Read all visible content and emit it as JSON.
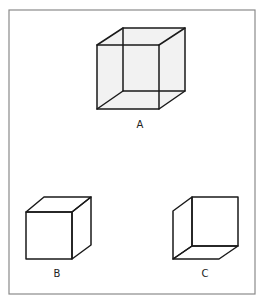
{
  "figure": {
    "frame": {
      "x": 9,
      "y": 10,
      "width": 246,
      "height": 284,
      "stroke": "#8a8a8a"
    },
    "colors": {
      "edge": "#1a1a1a",
      "face_fill": "#f2f2f2",
      "label": "#222222",
      "background": "#ffffff"
    },
    "cubes": [
      {
        "id": "A",
        "label": "A",
        "kind": "wireframe-ambiguous",
        "shaded": true,
        "front": {
          "tl": [
            97,
            45
          ],
          "tr": [
            159,
            45
          ],
          "br": [
            159,
            109
          ],
          "bl": [
            97,
            109
          ]
        },
        "back": {
          "tl": [
            123,
            28
          ],
          "tr": [
            185,
            28
          ],
          "br": [
            185,
            91
          ],
          "bl": [
            123,
            91
          ]
        },
        "label_pos": [
          140,
          125
        ]
      },
      {
        "id": "B",
        "label": "B",
        "kind": "viewed-from-above",
        "shaded": false,
        "front": {
          "tl": [
            26,
            212
          ],
          "tr": [
            72,
            212
          ],
          "br": [
            72,
            259
          ],
          "bl": [
            26,
            259
          ]
        },
        "back": {
          "tl": [
            44,
            197
          ],
          "tr": [
            91,
            197
          ],
          "br": [
            91,
            245
          ]
        },
        "label_pos": [
          57,
          274
        ]
      },
      {
        "id": "C",
        "label": "C",
        "kind": "viewed-from-below",
        "shaded": false,
        "front": {
          "tl": [
            173,
            211
          ],
          "bl": [
            173,
            259
          ],
          "br": [
            219,
            259
          ]
        },
        "back": {
          "tl": [
            192,
            197
          ],
          "tr": [
            238,
            197
          ],
          "br": [
            238,
            246
          ],
          "bl": [
            192,
            246
          ]
        },
        "label_pos": [
          205,
          274
        ]
      }
    ]
  }
}
